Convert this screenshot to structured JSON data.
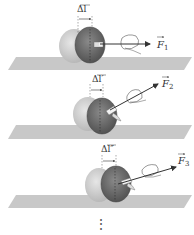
{
  "figure": {
    "panels": [
      {
        "delta_label": "Δl",
        "prime": "",
        "force_label": "F",
        "force_sub": "1"
      },
      {
        "delta_label": "Δl",
        "prime": "′",
        "force_label": "F",
        "force_sub": "2"
      },
      {
        "delta_label": "Δl",
        "prime": "″",
        "force_label": "F",
        "force_sub": "3"
      }
    ],
    "continuation": "⋮"
  },
  "colors": {
    "table": "#c8c8c8",
    "apple_light": "#cfcfcf",
    "apple_dark": "#6e6e6e",
    "arrow": "#333333",
    "text": "#333333"
  }
}
